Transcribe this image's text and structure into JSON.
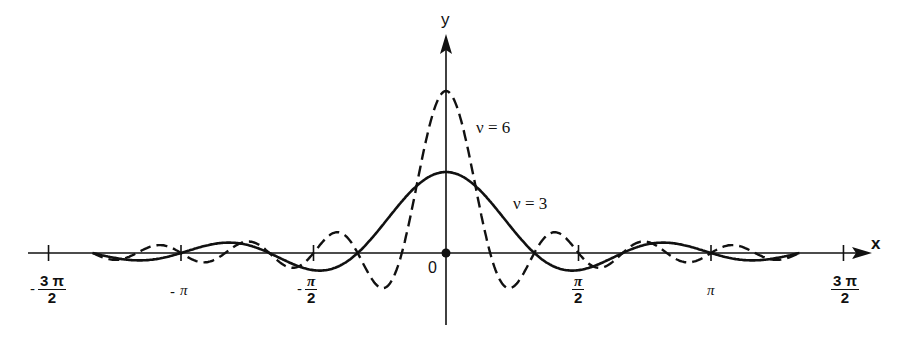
{
  "chart_data": {
    "type": "line",
    "title": "",
    "xlabel": "x",
    "ylabel": "y",
    "origin_label": "0",
    "xlim": [
      -4.712,
      4.712
    ],
    "x_ticks": [
      {
        "value": -4.712,
        "label": "-3π/2"
      },
      {
        "value": -3.1416,
        "label": "-π"
      },
      {
        "value": -1.5708,
        "label": "-π/2"
      },
      {
        "value": 1.5708,
        "label": "π/2"
      },
      {
        "value": 3.1416,
        "label": "π"
      },
      {
        "value": 4.712,
        "label": "3π/2"
      }
    ],
    "grid": false,
    "legend": "inline labels",
    "series": [
      {
        "name": "ν = 3",
        "style": "solid",
        "nu": 3,
        "peak": 1.0,
        "x_range": [
          -4.19,
          4.19
        ],
        "zeros": [
          -3.1416,
          -2.094,
          -1.047,
          1.047,
          2.094,
          3.1416
        ]
      },
      {
        "name": "ν = 6",
        "style": "dashed",
        "nu": 6,
        "peak": 2.0,
        "x_range": [
          -4.19,
          4.19
        ],
        "zeros": [
          -3.1416,
          -2.618,
          -2.094,
          -1.571,
          -1.047,
          -0.524,
          0.524,
          1.047,
          1.571,
          2.094,
          2.618,
          3.1416
        ]
      }
    ]
  },
  "labels": {
    "x_axis": "x",
    "y_axis": "y",
    "origin": "0",
    "nu6": "ν = 6",
    "nu3": "ν = 3",
    "ticks": {
      "neg3pi2_num": "3 π",
      "neg3pi2_den": "2",
      "negpi": "π",
      "negpi2_num": "π",
      "negpi2_den": "2",
      "pi2_num": "π",
      "pi2_den": "2",
      "pi": "π",
      "pi3_2_num": "3 π",
      "pi3_2_den": "2",
      "minus": "-"
    }
  }
}
